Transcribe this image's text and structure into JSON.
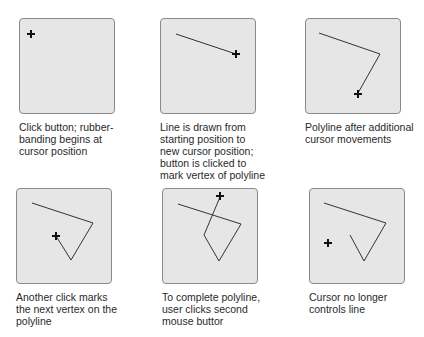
{
  "steps": [
    {
      "caption_lines": [
        "Click button; rubber-",
        "banding begins at",
        "cursor position"
      ],
      "polyline": [],
      "cursor": [
        31,
        34
      ]
    },
    {
      "caption_lines": [
        "Line is drawn from",
        "starting position to",
        "new cursor position;",
        "button is clicked to",
        "mark vertex of polyline"
      ],
      "polyline": [
        [
          176,
          34
        ],
        [
          236,
          54
        ]
      ],
      "cursor": [
        236,
        54
      ]
    },
    {
      "caption_lines": [
        "Polyline after additional",
        "cursor movements"
      ],
      "polyline": [
        [
          319,
          33
        ],
        [
          380,
          54
        ],
        [
          358,
          93
        ]
      ],
      "cursor": [
        358,
        94
      ]
    },
    {
      "caption_lines": [
        "Another click marks",
        "the next vertex on the",
        "polyline"
      ],
      "polyline": [
        [
          32,
          203
        ],
        [
          93,
          223
        ],
        [
          71,
          260
        ],
        [
          56,
          236
        ]
      ],
      "cursor": [
        56,
        236
      ]
    },
    {
      "caption_lines": [
        "To complete polyline,",
        "user clicks second",
        "mouse buttor"
      ],
      "polyline": [
        [
          178,
          204
        ],
        [
          241,
          224
        ],
        [
          219,
          261
        ],
        [
          204,
          235
        ],
        [
          220,
          197
        ]
      ],
      "cursor": [
        220,
        196
      ]
    },
    {
      "caption_lines": [
        "Cursor no longer",
        "controls line"
      ],
      "polyline": [
        [
          324,
          203
        ],
        [
          386,
          223
        ],
        [
          364,
          261
        ],
        [
          350,
          235
        ]
      ],
      "cursor": [
        328,
        243
      ]
    }
  ],
  "colors": {
    "panel_bg": "#e6e6e6",
    "panel_border": "#8a8a8a",
    "line": "#333333",
    "cursor": "#111111"
  }
}
